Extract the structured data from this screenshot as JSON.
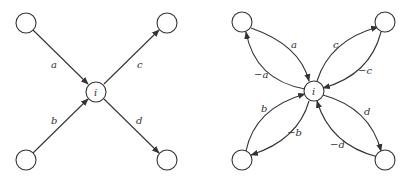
{
  "left_diagram": {
    "center_label": "i",
    "edges": [
      {
        "label": "a",
        "direction": "in",
        "from": "top-left"
      },
      {
        "label": "b",
        "direction": "in",
        "from": "bottom-left"
      },
      {
        "label": "c",
        "direction": "out",
        "to": "top-right"
      },
      {
        "label": "d",
        "direction": "out",
        "to": "bottom-right"
      }
    ]
  },
  "right_diagram": {
    "center_label": "i",
    "edges": [
      {
        "label": "a",
        "direction": "in",
        "from": "top-left"
      },
      {
        "label": "−a",
        "direction": "out",
        "to": "top-left"
      },
      {
        "label": "b",
        "direction": "in",
        "from": "bottom-left"
      },
      {
        "label": "−b",
        "direction": "out",
        "to": "bottom-left"
      },
      {
        "label": "c",
        "direction": "out",
        "to": "top-right"
      },
      {
        "label": "−c",
        "direction": "in",
        "from": "top-right"
      },
      {
        "label": "d",
        "direction": "out",
        "to": "bottom-right"
      },
      {
        "label": "−d",
        "direction": "in",
        "from": "bottom-right"
      }
    ]
  },
  "colors": {
    "stroke": "#333333",
    "background": "#ffffff"
  }
}
